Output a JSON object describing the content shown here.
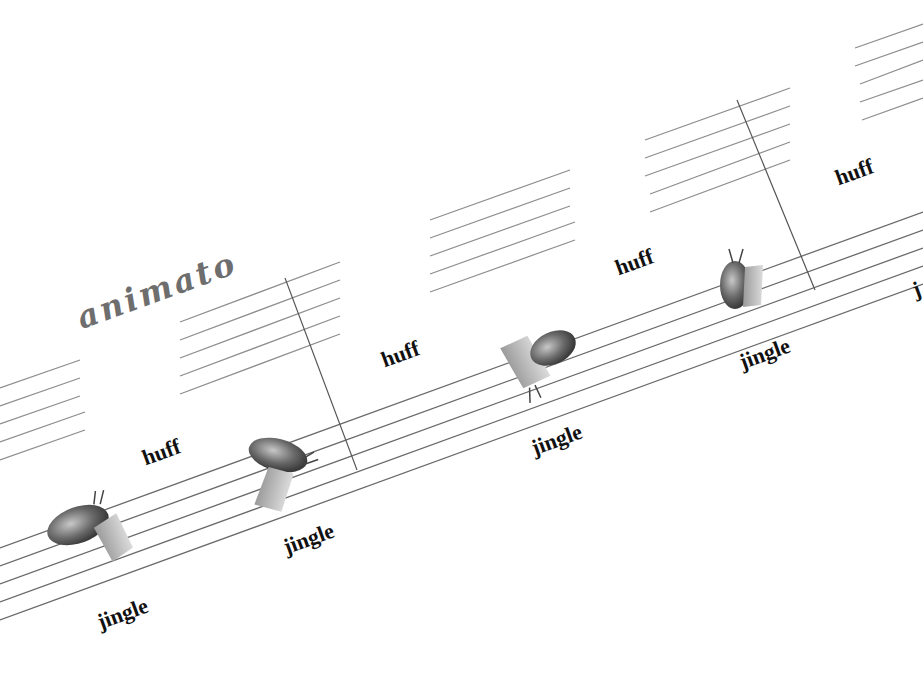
{
  "tempo_marking": "animato",
  "labels": {
    "huff_1": "huff",
    "huff_2": "huff",
    "huff_3": "huff",
    "huff_4": "huff",
    "jingle_1": "jingle",
    "jingle_2": "jingle",
    "jingle_3": "jingle",
    "jingle_4": "jingle",
    "partial_right": "j"
  },
  "instruments": [
    {
      "name": "bagpipe-like instrument",
      "position": "staff 1, beat 1"
    },
    {
      "name": "bagpipe-like instrument",
      "position": "staff 1, beat 2"
    },
    {
      "name": "bagpipe-like instrument",
      "position": "staff 2, beat 1"
    },
    {
      "name": "bagpipe-like instrument",
      "position": "staff 2, beat 2"
    }
  ],
  "colors": {
    "ink": "#111111",
    "staff_line": "#6a6a6a",
    "tempo": "#6e6e6e",
    "background": "#ffffff"
  }
}
